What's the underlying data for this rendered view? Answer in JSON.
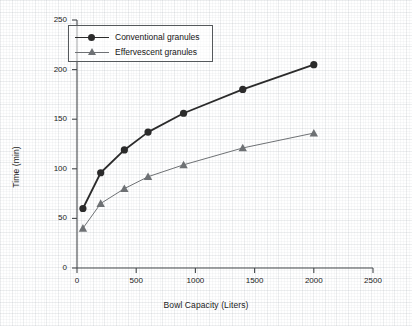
{
  "chart_data": {
    "type": "line",
    "title": "",
    "subtitle": "",
    "xlabel": "Bowl Capacity (Liters)",
    "ylabel": "Time (min)",
    "xlim": [
      0,
      2500
    ],
    "ylim": [
      0,
      250
    ],
    "xticks": [
      0,
      500,
      1000,
      1500,
      2000,
      2500
    ],
    "yticks": [
      0,
      50,
      100,
      150,
      200,
      250
    ],
    "xtick_labels": [
      "0",
      "500",
      "1000",
      "1500",
      "2000",
      "2500"
    ],
    "ytick_labels": [
      "0",
      "50",
      "100",
      "150",
      "200",
      "250"
    ],
    "grid": false,
    "legend_position": "upper left",
    "series": [
      {
        "name": "Conventional granules",
        "marker": "circle",
        "color": "#2b2b2b",
        "line_width": 1.8,
        "x": [
          50,
          200,
          400,
          600,
          900,
          1400,
          2000
        ],
        "y": [
          60,
          96,
          119,
          137,
          156,
          180,
          205
        ]
      },
      {
        "name": "Effervescent granules",
        "marker": "triangle",
        "color": "#6e7174",
        "line_width": 1.0,
        "x": [
          50,
          200,
          400,
          600,
          900,
          1400,
          2000
        ],
        "y": [
          40,
          65,
          80,
          92,
          104,
          121,
          136
        ]
      }
    ]
  },
  "legend": {
    "items": [
      {
        "label": "Conventional granules"
      },
      {
        "label": "Effervescent granules"
      }
    ]
  },
  "axes": {
    "x_axis_label": "Bowl Capacity (Liters)",
    "y_axis_label": "Time (min)"
  },
  "colors": {
    "axis": "#44484b",
    "series_1": "#2b2b2b",
    "series_2": "#6e7174",
    "background": "#ffffff"
  }
}
